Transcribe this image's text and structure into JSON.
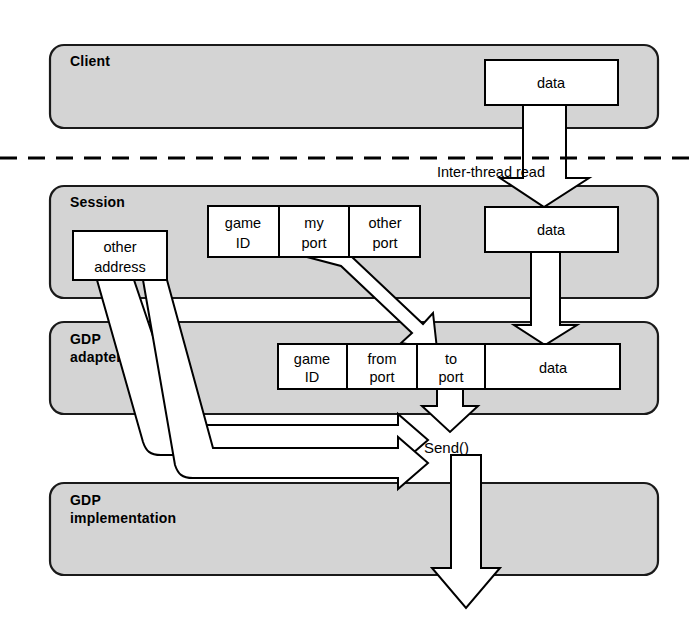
{
  "diagram": {
    "colors": {
      "band_fill": "#d4d4d4",
      "band_stroke": "#1a1a1a",
      "box_fill": "#ffffff",
      "box_stroke": "#000000",
      "arrow_fill": "#ffffff",
      "arrow_stroke": "#000000",
      "background": "#ffffff"
    },
    "bands": [
      {
        "id": "client",
        "label": "Client"
      },
      {
        "id": "session",
        "label": "Session"
      },
      {
        "id": "gdp_adapter",
        "label_line1": "GDP",
        "label_line2": "adapter"
      },
      {
        "id": "gdp_implementation",
        "label_line1": "GDP",
        "label_line2": "implementation"
      }
    ],
    "boxes": {
      "client_data": {
        "label": "data"
      },
      "session_data": {
        "label": "data"
      },
      "other_address": {
        "line1": "other",
        "line2": "address"
      }
    },
    "session_tuple": {
      "cells": [
        {
          "line1": "game",
          "line2": "ID"
        },
        {
          "line1": "my",
          "line2": "port"
        },
        {
          "line1": "other",
          "line2": "port"
        }
      ]
    },
    "packet": {
      "cells": [
        {
          "line1": "game",
          "line2": "ID"
        },
        {
          "line1": "from",
          "line2": "port"
        },
        {
          "line1": "to",
          "line2": "port"
        },
        {
          "line1": "data",
          "line2": ""
        }
      ]
    },
    "annotations": {
      "inter_thread_read": "Inter-thread read",
      "send_call": "Send()"
    },
    "arrows": [
      {
        "id": "client-to-session-data",
        "kind": "vertical-block-arrow",
        "from": "client_data",
        "to": "session_data"
      },
      {
        "id": "session-data-to-packet-data",
        "kind": "vertical-block-arrow",
        "from": "session_data",
        "to": "packet.data"
      },
      {
        "id": "ports-to-packet",
        "kind": "diagonal-block-arrow",
        "from": "session_tuple.my_port",
        "to": "packet.from_port"
      },
      {
        "id": "other-address-to-send-upper",
        "kind": "ribbon-arrow",
        "from": "other_address",
        "to": "send_call"
      },
      {
        "id": "other-address-to-send-lower",
        "kind": "ribbon-arrow",
        "from": "other_address",
        "to": "send_call"
      },
      {
        "id": "packet-to-send",
        "kind": "vertical-block-arrow",
        "from": "packet.to_port",
        "to": "send_call"
      },
      {
        "id": "send-to-gdp-implementation",
        "kind": "vertical-block-arrow",
        "from": "send_call",
        "to": "gdp_implementation"
      }
    ]
  }
}
